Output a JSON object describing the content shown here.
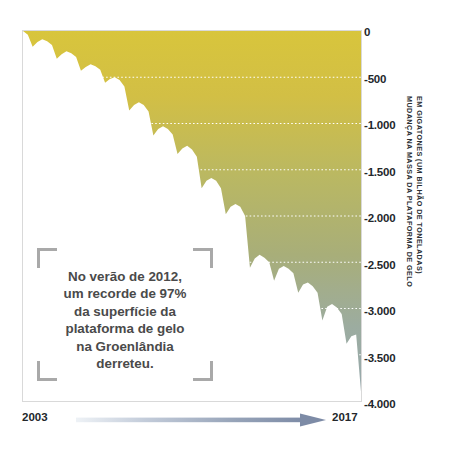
{
  "figure": {
    "caption_text": "No verão de 2012,\num recorde de 97%\nda superfície da\nplataforma de gelo\nna Groenlândia\nderreteu."
  },
  "y_axis": {
    "title_line_1": "MUDANÇA NA MASSA DA PLATAFORMA DE GELO",
    "title_line_2": "EM GIGATONES (UM BILHÃO DE TONELADAS)",
    "ticks": [
      "0",
      "-500",
      "-1.000",
      "-1.500",
      "-2.000",
      "-2.500",
      "-3.000",
      "-3.500",
      "-4.000"
    ]
  },
  "x_axis": {
    "start_label": "2003",
    "end_label": "2017",
    "arrow_icon": "right-arrow-icon"
  },
  "colors": {
    "gradient_top": "#d4c13f",
    "gradient_mid": "#a8ae75",
    "gradient_bottom": "#9aabad",
    "gridline": "#ffffff",
    "frame_border": "#d9d9d9",
    "bracket": "#a9a9a9",
    "text": "#23272b",
    "caption_text": "#4a4a4a",
    "arrow_start": "#e7ecf2",
    "arrow_end": "#7d8ba6"
  },
  "chart_data": {
    "type": "area",
    "title": "",
    "subtitle": "",
    "xlabel": "",
    "ylabel": "MUDANÇA NA MASSA DA PLATAFORMA DE GELO EM GIGATONES (UM BILHÃO DE TONELADAS)",
    "xlim": [
      2003,
      2017
    ],
    "ylim": [
      -4000,
      0
    ],
    "yticks": [
      0,
      -500,
      -1000,
      -1500,
      -2000,
      -2500,
      -3000,
      -3500,
      -4000
    ],
    "ytick_labels": [
      "0",
      "-500",
      "-1.000",
      "-1.500",
      "-2.000",
      "-2.500",
      "-3.000",
      "-3.500",
      "-4.000"
    ],
    "xticks": [
      2003,
      2017
    ],
    "xtick_labels": [
      "2003",
      "2017"
    ],
    "grid": true,
    "grid_style": "dotted-horizontal-white",
    "legend": false,
    "annotations": [
      {
        "text": "No verão de 2012, um recorde de 97% da superfície da plataforma de gelo na Groenlândia derreteu.",
        "x": 2007.0,
        "y": -2600
      }
    ],
    "series": [
      {
        "name": "Mudança na massa da plataforma de gelo (Gt)",
        "fill_gradient": [
          "#d4c13f",
          "#a8ae75",
          "#9aabad"
        ],
        "x": [
          2003.0,
          2003.2,
          2003.4,
          2003.6,
          2003.8,
          2004.0,
          2004.2,
          2004.4,
          2004.6,
          2004.8,
          2005.0,
          2005.2,
          2005.4,
          2005.6,
          2005.8,
          2006.0,
          2006.2,
          2006.4,
          2006.6,
          2006.8,
          2007.0,
          2007.2,
          2007.4,
          2007.6,
          2007.8,
          2008.0,
          2008.2,
          2008.4,
          2008.6,
          2008.8,
          2009.0,
          2009.2,
          2009.4,
          2009.6,
          2009.8,
          2010.0,
          2010.2,
          2010.4,
          2010.6,
          2010.8,
          2011.0,
          2011.2,
          2011.4,
          2011.6,
          2011.8,
          2012.0,
          2012.2,
          2012.4,
          2012.6,
          2012.8,
          2013.0,
          2013.2,
          2013.4,
          2013.6,
          2013.8,
          2014.0,
          2014.2,
          2014.4,
          2014.6,
          2014.8,
          2015.0,
          2015.2,
          2015.4,
          2015.6,
          2015.8,
          2016.0,
          2016.2,
          2016.4,
          2016.6,
          2016.8,
          2017.0
        ],
        "y": [
          0,
          -40,
          -170,
          -120,
          -90,
          -110,
          -150,
          -300,
          -250,
          -220,
          -240,
          -280,
          -430,
          -390,
          -360,
          -380,
          -420,
          -560,
          -520,
          -500,
          -530,
          -600,
          -860,
          -800,
          -770,
          -800,
          -870,
          -1130,
          -1060,
          -1030,
          -1060,
          -1120,
          -1330,
          -1270,
          -1240,
          -1280,
          -1360,
          -1700,
          -1620,
          -1590,
          -1620,
          -1700,
          -1980,
          -1900,
          -1870,
          -1900,
          -2000,
          -2560,
          -2460,
          -2420,
          -2450,
          -2500,
          -2700,
          -2570,
          -2540,
          -2570,
          -2620,
          -2830,
          -2740,
          -2720,
          -2760,
          -2830,
          -3130,
          -2980,
          -2950,
          -2990,
          -3060,
          -3380,
          -3300,
          -3280,
          -3900
        ]
      }
    ]
  }
}
